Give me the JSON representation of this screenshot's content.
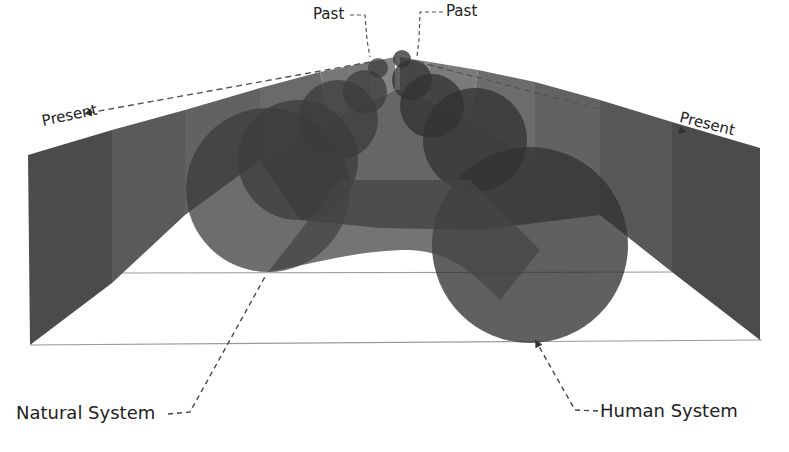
{
  "diagram": {
    "type": "3d-perspective-timeline",
    "labels": {
      "past_left": "Past",
      "past_right": "Past",
      "present_left": "Present",
      "present_right": "Present",
      "natural_system": "Natural System",
      "human_system": "Human System"
    },
    "colors": {
      "background": "#ffffff",
      "wall_dark": "#4a4a4a",
      "wall_mid": "#5a5a5a",
      "wall_light": "#6e6e6e",
      "circle_fill": "#3a3a3a",
      "floor_line": "#999999",
      "dash": "#555555",
      "text": "#222222"
    },
    "series": [
      {
        "name": "Natural System",
        "side": "left",
        "description": "circles increasing in size from apex to front-left"
      },
      {
        "name": "Human System",
        "side": "right",
        "description": "circles increasing in size from apex to front-right"
      }
    ]
  }
}
